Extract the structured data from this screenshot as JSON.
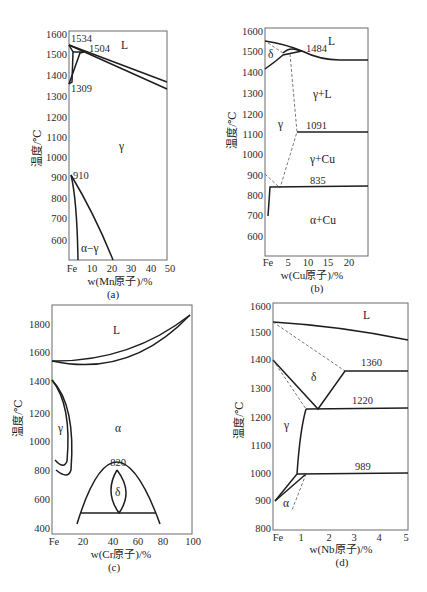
{
  "panels": {
    "a": {
      "caption": "(a)",
      "xlabel": "w(Mn原子)/%",
      "ylabel": "温度/℃",
      "yticks": [
        "1600",
        "1500",
        "1400",
        "1300",
        "1200",
        "1100",
        "1000",
        "900",
        "800",
        "700",
        "600"
      ],
      "xticks": [
        "Fe",
        "10",
        "20",
        "30",
        "40",
        "50"
      ],
      "annotations": [
        "1534",
        "1504",
        "1309",
        "910"
      ],
      "phases": {
        "L": "L",
        "gamma": "γ",
        "alpha_gamma": "α−γ"
      }
    },
    "b": {
      "caption": "(b)",
      "xlabel": "w(Cu原子)/%",
      "ylabel": "温度/℃",
      "yticks": [
        "1600",
        "1500",
        "1400",
        "1300",
        "1200",
        "1100",
        "1000",
        "900",
        "800",
        "700",
        "600"
      ],
      "xticks": [
        "Fe",
        "5",
        "10",
        "15",
        "20"
      ],
      "annotations": [
        "1484",
        "1091",
        "835"
      ],
      "phases": {
        "L": "L",
        "delta": "δ",
        "gamma": "γ",
        "gamma_L": "γ+L",
        "gamma_Cu": "γ+Cu",
        "alpha_Cu": "α+Cu"
      }
    },
    "c": {
      "caption": "(c)",
      "xlabel": "w(Cr原子)/%",
      "ylabel": "温度/℃",
      "yticks": [
        "1800",
        "1600",
        "1400",
        "1200",
        "1000",
        "800",
        "600",
        "400"
      ],
      "xticks": [
        "Fe",
        "20",
        "40",
        "60",
        "80",
        "100"
      ],
      "annotations": [
        "820"
      ],
      "phases": {
        "L": "L",
        "gamma": "γ",
        "alpha": "α",
        "delta": "δ"
      }
    },
    "d": {
      "caption": "(d)",
      "xlabel": "w(Nb原子)/%",
      "ylabel": "温度/℃",
      "yticks": [
        "1600",
        "1500",
        "1400",
        "1300",
        "1200",
        "1100",
        "1000",
        "900",
        "800"
      ],
      "xticks": [
        "Fe",
        "1",
        "2",
        "3",
        "4",
        "5"
      ],
      "annotations": [
        "1360",
        "1220",
        "989"
      ],
      "phases": {
        "L": "L",
        "delta": "δ",
        "gamma": "γ",
        "alpha": "α"
      }
    }
  }
}
